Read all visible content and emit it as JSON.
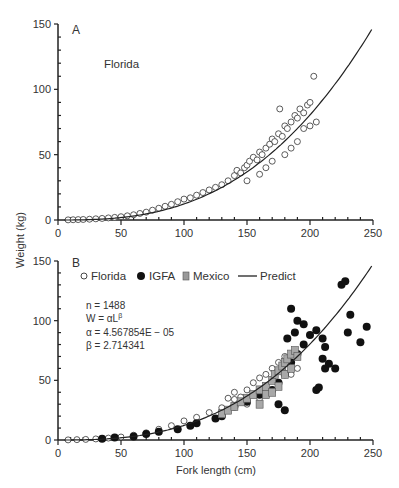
{
  "chart_data": [
    {
      "type": "scatter",
      "panel": "A",
      "title": "Florida",
      "xlabel": "",
      "ylabel": "Weight (kg)",
      "xlim": [
        0,
        250
      ],
      "ylim": [
        0,
        150
      ],
      "xticks": [
        0,
        50,
        100,
        150,
        200,
        250
      ],
      "yticks": [
        0,
        50,
        100,
        150
      ],
      "grid": false,
      "series": [
        {
          "name": "Florida",
          "marker": "open-circle",
          "points": [
            [
              8,
              0.1
            ],
            [
              12,
              0.2
            ],
            [
              16,
              0.3
            ],
            [
              20,
              0.4
            ],
            [
              25,
              0.6
            ],
            [
              30,
              0.9
            ],
            [
              35,
              1.2
            ],
            [
              40,
              1.6
            ],
            [
              45,
              2
            ],
            [
              50,
              2.5
            ],
            [
              55,
              3.2
            ],
            [
              60,
              4
            ],
            [
              65,
              5
            ],
            [
              70,
              6
            ],
            [
              75,
              7.5
            ],
            [
              80,
              9
            ],
            [
              85,
              10.5
            ],
            [
              90,
              12
            ],
            [
              95,
              14
            ],
            [
              100,
              16
            ],
            [
              105,
              17
            ],
            [
              110,
              19
            ],
            [
              115,
              21
            ],
            [
              120,
              23
            ],
            [
              125,
              25
            ],
            [
              130,
              27
            ],
            [
              135,
              30
            ],
            [
              140,
              34
            ],
            [
              142,
              38
            ],
            [
              145,
              36
            ],
            [
              148,
              40
            ],
            [
              150,
              42
            ],
            [
              152,
              45
            ],
            [
              155,
              48
            ],
            [
              158,
              46
            ],
            [
              160,
              52
            ],
            [
              162,
              50
            ],
            [
              165,
              55
            ],
            [
              168,
              58
            ],
            [
              170,
              62
            ],
            [
              172,
              60
            ],
            [
              175,
              66
            ],
            [
              178,
              64
            ],
            [
              180,
              72
            ],
            [
              182,
              70
            ],
            [
              185,
              75
            ],
            [
              188,
              80
            ],
            [
              190,
              78
            ],
            [
              192,
              85
            ],
            [
              195,
              82
            ],
            [
              198,
              88
            ],
            [
              200,
              90
            ],
            [
              203,
              110
            ],
            [
              176,
              85
            ],
            [
              165,
              40
            ],
            [
              185,
              55
            ],
            [
              190,
              60
            ],
            [
              150,
              30
            ],
            [
              160,
              35
            ],
            [
              170,
              45
            ],
            [
              180,
              50
            ],
            [
              195,
              70
            ],
            [
              200,
              72
            ],
            [
              205,
              75
            ]
          ]
        },
        {
          "name": "Predict",
          "type": "line",
          "formula": "W = 4.567854E-05 * L^2.714341",
          "x_range": [
            0,
            250
          ]
        }
      ]
    },
    {
      "type": "scatter",
      "panel": "B",
      "xlabel": "Fork length (cm)",
      "ylabel": "Weight (kg)",
      "xlim": [
        0,
        250
      ],
      "ylim": [
        0,
        150
      ],
      "xticks": [
        0,
        50,
        100,
        150,
        200,
        250
      ],
      "yticks": [
        0,
        50,
        100,
        150
      ],
      "grid": false,
      "legend": [
        "Florida",
        "IGFA",
        "Mexico",
        "Predict"
      ],
      "legend_position": "top",
      "annotation": {
        "n": "n = 1488",
        "model": "W = αL^β",
        "alpha": "α = 4.567854E − 05",
        "beta": "β = 2.714341"
      },
      "series": [
        {
          "name": "Florida",
          "marker": "open-circle",
          "points": [
            [
              8,
              0.1
            ],
            [
              15,
              0.3
            ],
            [
              22,
              0.5
            ],
            [
              30,
              0.9
            ],
            [
              40,
              1.6
            ],
            [
              50,
              2.5
            ],
            [
              60,
              4
            ],
            [
              70,
              6
            ],
            [
              80,
              9
            ],
            [
              90,
              12
            ],
            [
              100,
              16
            ],
            [
              110,
              19
            ],
            [
              120,
              23
            ],
            [
              130,
              27
            ],
            [
              140,
              34
            ],
            [
              145,
              36
            ],
            [
              150,
              42
            ],
            [
              155,
              48
            ],
            [
              160,
              52
            ],
            [
              165,
              55
            ],
            [
              170,
              60
            ],
            [
              175,
              65
            ],
            [
              180,
              70
            ],
            [
              150,
              30
            ],
            [
              160,
              35
            ],
            [
              185,
              55
            ],
            [
              190,
              60
            ],
            [
              140,
              40
            ],
            [
              135,
              35
            ]
          ]
        },
        {
          "name": "IGFA",
          "marker": "filled-circle",
          "points": [
            [
              35,
              1
            ],
            [
              45,
              2
            ],
            [
              60,
              3
            ],
            [
              70,
              5
            ],
            [
              80,
              7
            ],
            [
              95,
              9
            ],
            [
              105,
              12
            ],
            [
              110,
              14
            ],
            [
              125,
              18
            ],
            [
              130,
              20
            ],
            [
              140,
              28
            ],
            [
              150,
              32
            ],
            [
              160,
              38
            ],
            [
              170,
              42
            ],
            [
              175,
              48
            ],
            [
              180,
              55
            ],
            [
              185,
              65
            ],
            [
              190,
              72
            ],
            [
              195,
              80
            ],
            [
              200,
              88
            ],
            [
              205,
              92
            ],
            [
              210,
              68
            ],
            [
              212,
              60
            ],
            [
              215,
              64
            ],
            [
              220,
              60
            ],
            [
              225,
              130
            ],
            [
              228,
              133
            ],
            [
              232,
              105
            ],
            [
              230,
              90
            ],
            [
              240,
              82
            ],
            [
              185,
              110
            ],
            [
              190,
              100
            ],
            [
              182,
              85
            ],
            [
              188,
              90
            ],
            [
              195,
              97
            ],
            [
              210,
              85
            ],
            [
              212,
              78
            ],
            [
              245,
              95
            ],
            [
              205,
              42
            ],
            [
              207,
              44
            ],
            [
              175,
              30
            ],
            [
              180,
              25
            ]
          ]
        },
        {
          "name": "Mexico",
          "marker": "gray-square",
          "points": [
            [
              130,
              22
            ],
            [
              135,
              25
            ],
            [
              140,
              28
            ],
            [
              145,
              32
            ],
            [
              150,
              35
            ],
            [
              155,
              38
            ],
            [
              160,
              42
            ],
            [
              165,
              45
            ],
            [
              170,
              50
            ],
            [
              172,
              55
            ],
            [
              175,
              58
            ],
            [
              178,
              62
            ],
            [
              180,
              65
            ],
            [
              182,
              68
            ],
            [
              185,
              72
            ],
            [
              188,
              75
            ],
            [
              190,
              70
            ],
            [
              175,
              45
            ],
            [
              165,
              38
            ],
            [
              160,
              30
            ],
            [
              170,
              40
            ],
            [
              180,
              55
            ],
            [
              185,
              60
            ]
          ]
        },
        {
          "name": "Predict",
          "type": "line",
          "formula": "W = 4.567854E-05 * L^2.714341",
          "x_range": [
            0,
            250
          ]
        }
      ]
    }
  ],
  "panelA": {
    "label": "A",
    "region": "Florida"
  },
  "panelB": {
    "label": "B"
  },
  "axes": {
    "ylabel": "Weight (kg)",
    "xlabel": "Fork length (cm)",
    "ticks_x": [
      "0",
      "50",
      "100",
      "150",
      "200",
      "250"
    ],
    "ticks_y": [
      "0",
      "50",
      "100",
      "150"
    ]
  },
  "legend": {
    "florida": "Florida",
    "igfa": "IGFA",
    "mexico": "Mexico",
    "predict": "Predict"
  },
  "annotation": {
    "n": "n = 1488",
    "model": "W = αL",
    "model_exp": "β",
    "alpha": "α = 4.567854E − 05",
    "beta": "β = 2.714341"
  },
  "colors": {
    "axis": "#222222",
    "mexico_fill": "#a8a8a8",
    "igfa_fill": "#111111",
    "florida_stroke": "#333333"
  }
}
